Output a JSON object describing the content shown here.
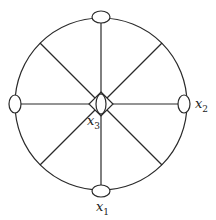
{
  "diagram": {
    "type": "graph-on-circle",
    "stroke_color": "#2a2a2a",
    "background": "#ffffff",
    "circle": {
      "cx": 101,
      "cy": 104,
      "r": 86
    },
    "spokes": 8,
    "vertices": [
      {
        "id": "top",
        "cx": 101,
        "cy": 17,
        "rx": 9,
        "ry": 6,
        "label": ""
      },
      {
        "id": "right",
        "cx": 184,
        "cy": 104,
        "rx": 6,
        "ry": 9,
        "label_main": "x",
        "label_sub": "2"
      },
      {
        "id": "bottom",
        "cx": 101,
        "cy": 191,
        "rx": 9,
        "ry": 6,
        "label_main": "x",
        "label_sub": "1"
      },
      {
        "id": "left",
        "cx": 15,
        "cy": 104,
        "rx": 6,
        "ry": 9,
        "label": ""
      },
      {
        "id": "center",
        "cx": 101,
        "cy": 104,
        "rx": 5,
        "ry": 10,
        "label_main": "x",
        "label_sub": "3"
      }
    ],
    "labels": {
      "x1": {
        "main": "x",
        "sub": "1"
      },
      "x2": {
        "main": "x",
        "sub": "2"
      },
      "x3": {
        "main": "x",
        "sub": "3"
      }
    }
  }
}
